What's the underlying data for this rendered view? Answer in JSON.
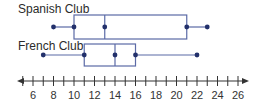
{
  "chart_data": {
    "type": "box",
    "title": "",
    "xlabel": "",
    "ylabel": "",
    "xlim": [
      6,
      26
    ],
    "ticks": [
      6,
      8,
      10,
      12,
      14,
      16,
      18,
      20,
      22,
      24,
      26
    ],
    "minor_tick_step": 1,
    "grid": false,
    "series": [
      {
        "name": "Spanish Club",
        "min": 8,
        "q1": 10,
        "median": 13,
        "q3": 21,
        "max": 23
      },
      {
        "name": "French Club",
        "min": 7,
        "q1": 11,
        "median": 14,
        "q3": 16,
        "max": 22
      }
    ]
  },
  "colors": {
    "box_line": "#5b6aa6",
    "dot": "#22306b",
    "axis": "#333333"
  }
}
